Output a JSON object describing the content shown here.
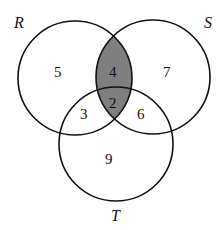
{
  "diagram": {
    "type": "venn",
    "sets": [
      {
        "name": "R",
        "cx": 75,
        "cy": 78,
        "r": 57
      },
      {
        "name": "S",
        "cx": 153,
        "cy": 77,
        "r": 57
      },
      {
        "name": "T",
        "cx": 116,
        "cy": 144,
        "r": 57
      }
    ],
    "set_labels": {
      "R": "R",
      "S": "S",
      "T": "T"
    },
    "regions": {
      "R_only": "5",
      "S_only": "7",
      "R_S_only": "4",
      "R_S_T": "2",
      "R_T_only": "3",
      "S_T_only": "6",
      "T_only": "9"
    },
    "shaded_region": "R ∩ S",
    "colors": {
      "shade": "#7f7f7f",
      "stroke": "#111111",
      "background": "#ffffff"
    }
  }
}
